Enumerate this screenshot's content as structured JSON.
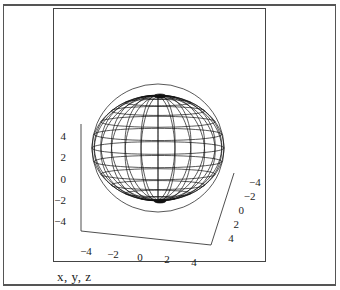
{
  "chart_data": {
    "type": "surface-3d-wireframe",
    "title": "",
    "surface": "sphere",
    "sphere": {
      "center": [
        0,
        0,
        0
      ],
      "radius": 5,
      "meridians": 24,
      "parallels": 12
    },
    "axes": {
      "vertical": {
        "ticks": [
          "4",
          "2",
          "0",
          "-2",
          "-4"
        ]
      },
      "right": {
        "ticks": [
          "-4",
          "-2",
          "0",
          "2",
          "4"
        ]
      },
      "bottom": {
        "ticks": [
          "-4",
          "-2",
          "0",
          "2",
          "4"
        ]
      }
    },
    "xlabel": "",
    "ylabel": "",
    "zlabel": "",
    "grid": false,
    "legend": null
  },
  "plot": {
    "variables_label": "x, y, z"
  },
  "colors": {
    "line": "#111111",
    "frame": "#444444",
    "background": "#ffffff"
  }
}
